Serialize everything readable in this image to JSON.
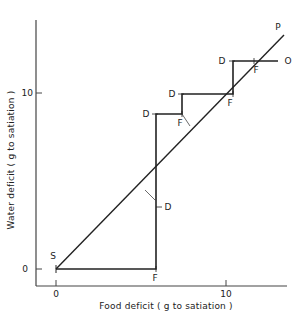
{
  "diagram": {
    "x_axis": {
      "label": "Food deficit  ( g to satiation )",
      "ticks": [
        {
          "value": "0"
        },
        {
          "value": "10"
        }
      ]
    },
    "y_axis": {
      "label": "Water deficit  ( g to satiation )",
      "ticks": [
        {
          "value": "0"
        },
        {
          "value": "10"
        }
      ]
    },
    "points": {
      "start": "S",
      "line_end": "P",
      "path_end": "O"
    },
    "markers": {
      "food": "F",
      "drink": "D"
    },
    "staircase_labels": [
      {
        "label": "F"
      },
      {
        "label": "D"
      },
      {
        "label": "D"
      },
      {
        "label": "F"
      },
      {
        "label": "D"
      },
      {
        "label": "F"
      },
      {
        "label": "D"
      },
      {
        "label": "F"
      }
    ]
  }
}
